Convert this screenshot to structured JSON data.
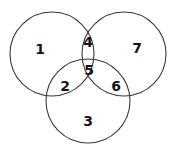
{
  "diagram": {
    "type": "venn",
    "background_color": "#ffffff",
    "stroke_color": "#3a3a3a",
    "label_color": "#161616",
    "circles": [
      {
        "name": "left-circle",
        "cx": 52,
        "cy": 54,
        "r": 42
      },
      {
        "name": "right-circle",
        "cx": 124,
        "cy": 54,
        "r": 42
      },
      {
        "name": "bottom-circle",
        "cx": 88,
        "cy": 101,
        "r": 42
      }
    ],
    "regions": [
      {
        "id": "1",
        "label": "1",
        "name": "region-left-only",
        "x": 40,
        "y": 49
      },
      {
        "id": "4",
        "label": "4",
        "name": "region-left-right",
        "x": 88,
        "y": 42
      },
      {
        "id": "7",
        "label": "7",
        "name": "region-right-only",
        "x": 137,
        "y": 48
      },
      {
        "id": "5",
        "label": "5",
        "name": "region-all-three",
        "x": 89,
        "y": 70
      },
      {
        "id": "2",
        "label": "2",
        "name": "region-left-bottom",
        "x": 65,
        "y": 86
      },
      {
        "id": "6",
        "label": "6",
        "name": "region-right-bottom",
        "x": 116,
        "y": 86
      },
      {
        "id": "3",
        "label": "3",
        "name": "region-bottom-only",
        "x": 88,
        "y": 121
      }
    ]
  }
}
